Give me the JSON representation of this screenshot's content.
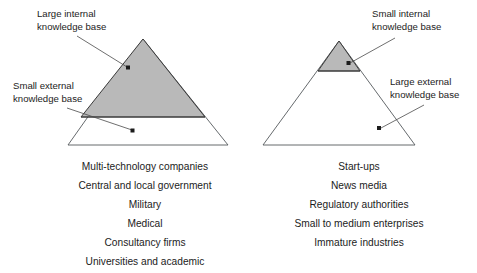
{
  "figure": {
    "background_color": "#ffffff",
    "shaded_fill": "#b9b9b9",
    "outline_color": "#55595c",
    "text_color": "#1c1c1c"
  },
  "left_panel": {
    "callouts": [
      {
        "id": "large-internal",
        "line1": "Large internal",
        "line2": "knowledge base",
        "points_to": "shaded upper region of left triangle"
      },
      {
        "id": "small-external",
        "line1": "Small external",
        "line2": "knowledge base",
        "points_to": "unshaded lower band of left triangle"
      }
    ],
    "triangle": {
      "apex_label": "",
      "shaded_portion": "upper-large",
      "unshaded_portion": "lower-band"
    },
    "list": [
      "Multi-technology companies",
      "Central and local government",
      "Military",
      "Medical",
      "Consultancy firms",
      "Universities and academic"
    ]
  },
  "right_panel": {
    "callouts": [
      {
        "id": "small-internal",
        "line1": "Small internal",
        "line2": "knowledge base",
        "points_to": "shaded apex region of right triangle"
      },
      {
        "id": "large-external",
        "line1": "Large external",
        "line2": "knowledge base",
        "points_to": "unshaded lower region of right triangle"
      }
    ],
    "triangle": {
      "apex_label": "",
      "shaded_portion": "upper-small",
      "unshaded_portion": "lower-large"
    },
    "list": [
      "Start-ups",
      "News media",
      "Regulatory authorities",
      "Small to medium enterprises",
      "Immature industries"
    ]
  }
}
